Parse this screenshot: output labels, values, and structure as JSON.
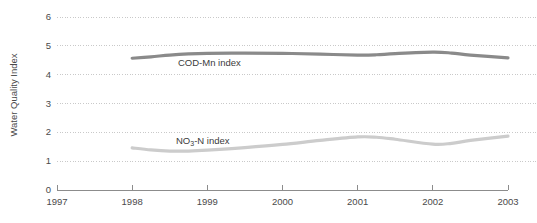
{
  "chart_data": {
    "type": "line",
    "title": "",
    "xlabel": "",
    "ylabel": "Water Quality Index",
    "xlim": [
      1997,
      2003
    ],
    "ylim": [
      0,
      6
    ],
    "grid": true,
    "legend_position": "inline-labels",
    "x_ticks": [
      "1997",
      "1998",
      "1999",
      "2000",
      "2001",
      "2002",
      "2003"
    ],
    "y_ticks": [
      "0",
      "1",
      "2",
      "3",
      "4",
      "5",
      "6"
    ],
    "series": [
      {
        "name": "COD-Mn index",
        "label_html": "COD-Mn index",
        "color": "#8a8a8a",
        "x": [
          1998,
          1998.25,
          1998.5,
          1998.75,
          1999,
          1999.5,
          2000,
          2000.5,
          2001,
          2001.25,
          2001.5,
          2002,
          2002.25,
          2002.5,
          2003
        ],
        "values": [
          4.57,
          4.62,
          4.68,
          4.72,
          4.74,
          4.75,
          4.74,
          4.71,
          4.68,
          4.69,
          4.73,
          4.78,
          4.75,
          4.68,
          4.58
        ]
      },
      {
        "name": "NO3-N index",
        "label_html": "NO<sub>3</sub>-N index",
        "color": "#cccccc",
        "x": [
          1998,
          1998.25,
          1998.5,
          1998.75,
          1999,
          1999.5,
          2000,
          2000.5,
          2001,
          2001.25,
          2001.5,
          2002,
          2002.25,
          2002.5,
          2003
        ],
        "values": [
          1.46,
          1.39,
          1.35,
          1.35,
          1.38,
          1.47,
          1.58,
          1.72,
          1.84,
          1.83,
          1.76,
          1.59,
          1.62,
          1.72,
          1.87
        ]
      }
    ],
    "annotations": [
      {
        "text": "COD-Mn index",
        "series": "COD-Mn index",
        "x_px": 178,
        "y_px": 58
      },
      {
        "text": "NO3-N index",
        "series": "NO3-N index",
        "x_px": 176,
        "y_px": 136
      }
    ]
  }
}
